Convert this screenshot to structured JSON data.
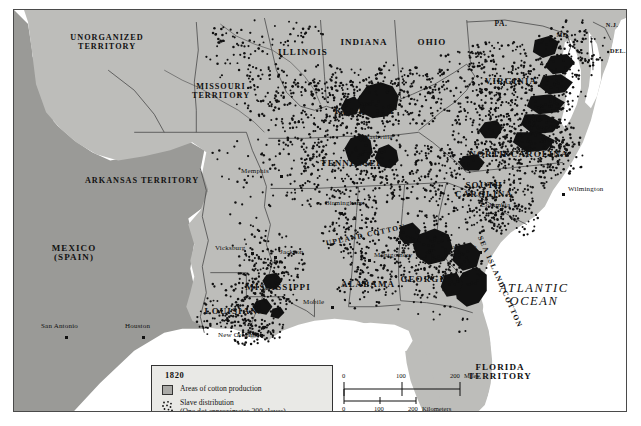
{
  "figure": {
    "kind": "historical-thematic-map",
    "title_in_legend": "1820"
  },
  "legend": {
    "year": "1820",
    "cotton_label": "Areas of cotton production",
    "slave_label_line1": "Slave distribution",
    "slave_label_line2": "(One dot approximates 200 slaves)",
    "swatch_color": "#a9a9a6",
    "box_fill": "#e9e9e6",
    "dot_color": "#111111"
  },
  "scale": {
    "miles_ticks": [
      "0",
      "100",
      "200"
    ],
    "miles_unit": "Miles",
    "km_ticks": [
      "0",
      "100",
      "200"
    ],
    "km_unit": "Kilometers"
  },
  "colors": {
    "land_us": "#bdbdba",
    "land_foreign": "#9a9a97",
    "water": "#ffffff",
    "cotton_area": "#111111",
    "border": "#4a4a4a",
    "page": "#ffffff"
  },
  "ocean_labels": [
    {
      "name": "atlantic-ocean",
      "line1": "ATLANTIC",
      "line2": "OCEAN",
      "x": 520,
      "y": 285
    }
  ],
  "cotton_region_labels": [
    {
      "name": "upland-cotton",
      "text": "UPLAND COTTON",
      "x": 352,
      "y": 225,
      "rotate": -12
    },
    {
      "name": "sea-island-cotton",
      "text": "SEA ISLAND COTTON",
      "x": 486,
      "y": 272,
      "rotate": 66
    }
  ],
  "states": [
    {
      "name": "unorganized-territory",
      "line1": "UNORGANIZED",
      "line2": "TERRITORY",
      "x": 93,
      "y": 33,
      "size": "terr"
    },
    {
      "name": "missouri-territory",
      "line1": "MISSOURI",
      "line2": "TERRITORY",
      "x": 207,
      "y": 82,
      "size": "terr"
    },
    {
      "name": "arkansas-territory",
      "line1": "ARKANSAS TERRITORY",
      "line2": "",
      "x": 128,
      "y": 171,
      "size": "terr"
    },
    {
      "name": "illinois",
      "line1": "ILLINOIS",
      "line2": "",
      "x": 289,
      "y": 43,
      "size": "state"
    },
    {
      "name": "indiana",
      "line1": "INDIANA",
      "line2": "",
      "x": 350,
      "y": 33,
      "size": "state"
    },
    {
      "name": "ohio",
      "line1": "OHIO",
      "line2": "",
      "x": 418,
      "y": 33,
      "size": "state"
    },
    {
      "name": "pennsylvania",
      "line1": "PA.",
      "line2": "",
      "x": 487,
      "y": 14,
      "size": "state-sm"
    },
    {
      "name": "new-jersey",
      "line1": "N.J.",
      "line2": "",
      "x": 598,
      "y": 15,
      "size": "state-xs"
    },
    {
      "name": "maryland",
      "line1": "MD.",
      "line2": "",
      "x": 549,
      "y": 25,
      "size": "state-xs"
    },
    {
      "name": "delaware",
      "line1": "DEL.",
      "line2": "",
      "x": 604,
      "y": 41,
      "size": "state-xs"
    },
    {
      "name": "virginia",
      "line1": "VIRGINIA",
      "line2": "",
      "x": 497,
      "y": 72,
      "size": "state"
    },
    {
      "name": "kentucky",
      "line1": "KENTUCKY",
      "line2": "",
      "x": 351,
      "y": 102,
      "size": "state"
    },
    {
      "name": "tennessee",
      "line1": "TENNESSEE",
      "line2": "",
      "x": 338,
      "y": 154,
      "size": "state"
    },
    {
      "name": "north-carolina",
      "line1": "NORTH CAROLINA",
      "line2": "",
      "x": 505,
      "y": 145,
      "size": "state"
    },
    {
      "name": "south-carolina",
      "line1": "SOUTH",
      "line2": "CAROLINA",
      "x": 470,
      "y": 180,
      "size": "state"
    },
    {
      "name": "georgia",
      "line1": "GEORGIA",
      "line2": "",
      "x": 412,
      "y": 270,
      "size": "state"
    },
    {
      "name": "alabama",
      "line1": "ALABAMA",
      "line2": "",
      "x": 354,
      "y": 275,
      "size": "state"
    },
    {
      "name": "mississippi",
      "line1": "MISSISSIPPI",
      "line2": "",
      "x": 264,
      "y": 278,
      "size": "state"
    },
    {
      "name": "louisiana",
      "line1": "LOUISIANA",
      "line2": "",
      "x": 221,
      "y": 302,
      "size": "state"
    },
    {
      "name": "florida-territory",
      "line1": "FLORIDA",
      "line2": "TERRITORY",
      "x": 486,
      "y": 362,
      "size": "state"
    },
    {
      "name": "mexico-spain",
      "line1": "MEXICO",
      "line2": "(SPAIN)",
      "x": 60,
      "y": 243,
      "size": "state"
    }
  ],
  "cities": [
    {
      "name": "memphis",
      "label": "Memphis",
      "x": 267,
      "y": 166,
      "dx": -40,
      "dy": -4
    },
    {
      "name": "nashville",
      "label": "Nashville",
      "x": 345,
      "y": 133,
      "dx": 5,
      "dy": -5
    },
    {
      "name": "birmingham",
      "label": "Birmingham",
      "x": 327,
      "y": 203,
      "dx": -16,
      "dy": -9
    },
    {
      "name": "atlanta",
      "label": "Atlanta",
      "x": 385,
      "y": 232,
      "dx": 5,
      "dy": -4
    },
    {
      "name": "montgomery",
      "label": "Montgomery",
      "x": 355,
      "y": 250,
      "dx": 5,
      "dy": -4
    },
    {
      "name": "vicksburg",
      "label": "Vicksburg",
      "x": 238,
      "y": 243,
      "dx": -37,
      "dy": -4
    },
    {
      "name": "jackson",
      "label": "Jackson",
      "x": 261,
      "y": 247,
      "dx": 5,
      "dy": -4
    },
    {
      "name": "mobile",
      "label": "Mobile",
      "x": 318,
      "y": 297,
      "dx": -29,
      "dy": -4
    },
    {
      "name": "new-orleans",
      "label": "New Orleans",
      "x": 247,
      "y": 325,
      "dx": -43,
      "dy": 1
    },
    {
      "name": "houston",
      "label": "Houston",
      "x": 129,
      "y": 327,
      "dx": -18,
      "dy": -10
    },
    {
      "name": "san-antonio",
      "label": "San Antonio",
      "x": 52,
      "y": 327,
      "dx": -25,
      "dy": -10
    },
    {
      "name": "columbia",
      "label": "Columbia",
      "x": 487,
      "y": 199,
      "dx": -20,
      "dy": -3
    },
    {
      "name": "wilmington",
      "label": "Wilmington",
      "x": 549,
      "y": 184,
      "dx": 5,
      "dy": -4
    },
    {
      "name": "savannah",
      "label": "Savannah",
      "x": 466,
      "y": 242,
      "dx": -32,
      "dy": -4
    }
  ]
}
